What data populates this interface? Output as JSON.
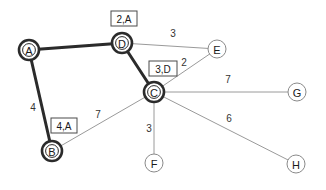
{
  "diagram": {
    "type": "weighted-graph-dijkstra",
    "width": 326,
    "height": 190,
    "background": "#ffffff",
    "colors": {
      "settled_node_stroke": "#2b2b2b",
      "unsettled_node_stroke": "#8a8a8a",
      "tree_edge": "#2b2b2b",
      "plain_edge": "#9a9a9a",
      "text": "#1a1a1a",
      "tag_box_stroke": "#4a4a4a"
    },
    "nodes": [
      {
        "id": "A",
        "label": "A",
        "x": 29,
        "y": 50,
        "r": 10,
        "settled": true
      },
      {
        "id": "B",
        "label": "B",
        "x": 52,
        "y": 151,
        "r": 10,
        "settled": true
      },
      {
        "id": "C",
        "label": "C",
        "x": 154,
        "y": 92,
        "r": 10,
        "settled": true
      },
      {
        "id": "D",
        "label": "D",
        "x": 122,
        "y": 43,
        "r": 10,
        "settled": true
      },
      {
        "id": "E",
        "label": "E",
        "x": 217,
        "y": 49,
        "r": 9,
        "settled": false
      },
      {
        "id": "F",
        "label": "F",
        "x": 154,
        "y": 163,
        "r": 9,
        "settled": false
      },
      {
        "id": "G",
        "label": "G",
        "x": 297,
        "y": 92,
        "r": 9,
        "settled": false
      },
      {
        "id": "H",
        "label": "H",
        "x": 296,
        "y": 164,
        "r": 9,
        "settled": false
      }
    ],
    "edges": [
      {
        "from": "A",
        "to": "D",
        "weight": "",
        "tree": true,
        "label_x": 0,
        "label_y": 0
      },
      {
        "from": "A",
        "to": "B",
        "weight": "4",
        "tree": true,
        "label_x": 33,
        "label_y": 107
      },
      {
        "from": "D",
        "to": "C",
        "weight": "",
        "tree": true,
        "label_x": 0,
        "label_y": 0
      },
      {
        "from": "D",
        "to": "E",
        "weight": "3",
        "tree": false,
        "label_x": 173,
        "label_y": 33
      },
      {
        "from": "C",
        "to": "E",
        "weight": "2",
        "tree": false,
        "label_x": 184,
        "label_y": 62
      },
      {
        "from": "C",
        "to": "G",
        "weight": "7",
        "tree": false,
        "label_x": 228,
        "label_y": 79
      },
      {
        "from": "C",
        "to": "F",
        "weight": "3",
        "tree": false,
        "label_x": 149,
        "label_y": 128
      },
      {
        "from": "C",
        "to": "H",
        "weight": "6",
        "tree": false,
        "label_x": 229,
        "label_y": 118
      },
      {
        "from": "B",
        "to": "C",
        "weight": "7",
        "tree": false,
        "label_x": 98,
        "label_y": 114
      }
    ],
    "tags": [
      {
        "node": "D",
        "text": "2,A",
        "x": 111,
        "y": 11,
        "w": 26,
        "h": 15
      },
      {
        "node": "C",
        "text": "3,D",
        "x": 149,
        "y": 61,
        "w": 28,
        "h": 15
      },
      {
        "node": "B",
        "text": "4,A",
        "x": 51,
        "y": 118,
        "w": 26,
        "h": 15
      }
    ]
  }
}
